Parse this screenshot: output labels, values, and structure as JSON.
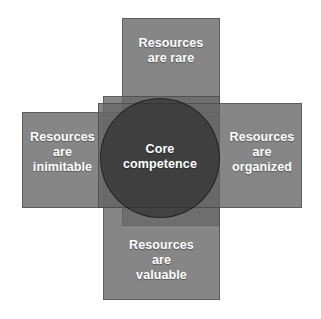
{
  "diagram": {
    "type": "venn-overlap",
    "center": {
      "name": "core-competence",
      "label": "Core\ncompetence",
      "shape": "circle",
      "fill": "#262626"
    },
    "criteria": [
      {
        "key": "rare",
        "position": "top",
        "label": "Resources\nare rare",
        "shape": "rectangle",
        "fill": "#686868"
      },
      {
        "key": "organized",
        "position": "right",
        "label": "Resources\nare\norganized",
        "shape": "rectangle",
        "fill": "#686868"
      },
      {
        "key": "valuable",
        "position": "bottom",
        "label": "Resources\nare\nvaluable",
        "shape": "rectangle",
        "fill": "#686868"
      },
      {
        "key": "inimitable",
        "position": "left",
        "label": "Resources\nare\ninimitable",
        "shape": "rectangle",
        "fill": "#686868"
      }
    ],
    "colors": {
      "background": "#ffffff",
      "rectangle_fill": "#686868",
      "circle_fill": "#262626",
      "text": "#ffffff",
      "outline": "#3c3c3c"
    }
  }
}
